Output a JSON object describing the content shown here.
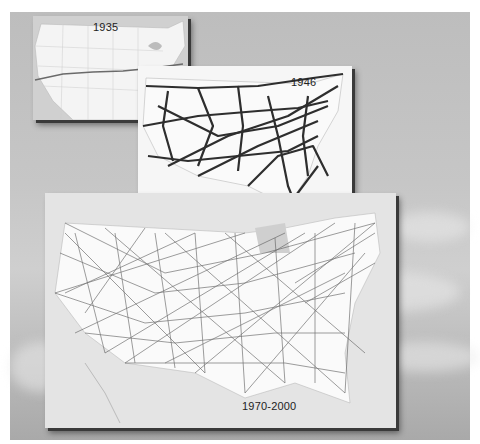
{
  "figure": {
    "background": "sky with clouds",
    "maps": [
      {
        "label": "1935",
        "density": "single transcontinental route"
      },
      {
        "label": "1946",
        "density": "sparse network of heavy routes"
      },
      {
        "label": "1970-2000",
        "density": "dense network of routes"
      }
    ]
  }
}
